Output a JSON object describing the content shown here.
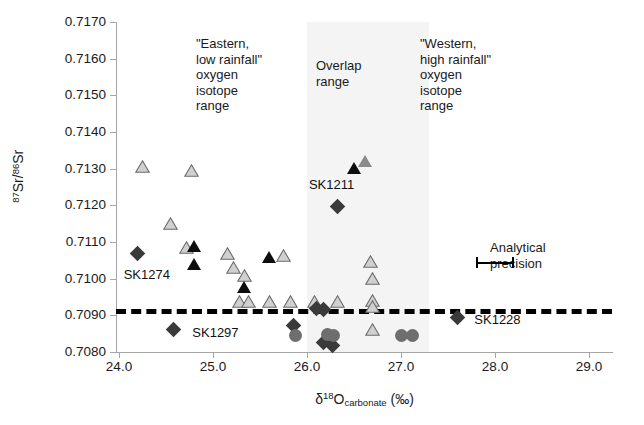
{
  "chart_data": {
    "type": "scatter",
    "title": "",
    "xlabel": "δ18O carbonate (‰)",
    "ylabel": "87Sr/86Sr",
    "xlim": [
      24.0,
      29.0
    ],
    "ylim": [
      0.708,
      0.717
    ],
    "xticks": [
      "24.0",
      "25.0",
      "26.0",
      "27.0",
      "28.0",
      "29.0"
    ],
    "yticks": [
      "0.7170",
      "0.7160",
      "0.7150",
      "0.7140",
      "0.7130",
      "0.7120",
      "0.7110",
      "0.7100",
      "0.7090",
      "0.7080"
    ],
    "grid": false,
    "legend": "none",
    "reference_line": {
      "label": "local biosphere baseline",
      "y": 0.70918,
      "style": "dashed",
      "color": "#000000"
    },
    "shaded_bands": [
      {
        "name": "overlap-range",
        "x_start": 26.0,
        "x_end": 27.3,
        "color": "#f4f4f4"
      }
    ],
    "error_bar": {
      "label": "Analytical precision",
      "x_start": 27.8,
      "x_end": 28.2,
      "y": 0.71045
    },
    "series": [
      {
        "name": "open-triangle",
        "marker": "triangle-open",
        "color": "#cccccc",
        "points": [
          {
            "x": 24.25,
            "y": 0.71305
          },
          {
            "x": 24.77,
            "y": 0.71295
          },
          {
            "x": 24.55,
            "y": 0.7115
          },
          {
            "x": 24.72,
            "y": 0.71085
          },
          {
            "x": 25.15,
            "y": 0.7107
          },
          {
            "x": 25.22,
            "y": 0.7103
          },
          {
            "x": 25.33,
            "y": 0.7101
          },
          {
            "x": 25.75,
            "y": 0.71062
          },
          {
            "x": 25.28,
            "y": 0.70938
          },
          {
            "x": 25.38,
            "y": 0.70938
          },
          {
            "x": 25.6,
            "y": 0.70938
          },
          {
            "x": 25.82,
            "y": 0.70938
          },
          {
            "x": 26.08,
            "y": 0.70938
          },
          {
            "x": 26.32,
            "y": 0.70938
          },
          {
            "x": 26.68,
            "y": 0.71048
          },
          {
            "x": 26.7,
            "y": 0.71
          },
          {
            "x": 26.7,
            "y": 0.7094
          },
          {
            "x": 26.7,
            "y": 0.70925
          },
          {
            "x": 26.7,
            "y": 0.70862
          }
        ]
      },
      {
        "name": "grey-triangle",
        "marker": "triangle-grey",
        "color": "#8a8a8a",
        "points": [
          {
            "x": 26.62,
            "y": 0.7132
          }
        ]
      },
      {
        "name": "filled-triangle",
        "marker": "triangle-filled",
        "color": "#0d0d0d",
        "points": [
          {
            "x": 24.8,
            "y": 0.7109
          },
          {
            "x": 24.8,
            "y": 0.7104
          },
          {
            "x": 25.33,
            "y": 0.70978
          },
          {
            "x": 25.6,
            "y": 0.71058
          },
          {
            "x": 26.5,
            "y": 0.71302
          }
        ]
      },
      {
        "name": "dark-diamond",
        "marker": "diamond",
        "color": "#3a3a3a",
        "points": [
          {
            "x": 24.22,
            "y": 0.71062
          },
          {
            "x": 24.6,
            "y": 0.70855
          },
          {
            "x": 25.88,
            "y": 0.70865
          },
          {
            "x": 26.2,
            "y": 0.7091
          },
          {
            "x": 26.2,
            "y": 0.7082
          },
          {
            "x": 26.3,
            "y": 0.70812
          },
          {
            "x": 26.12,
            "y": 0.70912
          },
          {
            "x": 26.35,
            "y": 0.7119
          },
          {
            "x": 27.62,
            "y": 0.70888
          }
        ]
      },
      {
        "name": "grey-circle",
        "marker": "circle",
        "color": "#6e6e6e",
        "points": [
          {
            "x": 25.88,
            "y": 0.70845
          },
          {
            "x": 26.28,
            "y": 0.70845
          },
          {
            "x": 26.22,
            "y": 0.70848
          },
          {
            "x": 27.0,
            "y": 0.70845
          },
          {
            "x": 27.12,
            "y": 0.70845
          }
        ]
      }
    ],
    "point_labels": [
      {
        "text": "SK1274",
        "x": 24.05,
        "y": 0.7101
      },
      {
        "text": "SK1297",
        "x": 24.78,
        "y": 0.70853
      },
      {
        "text": "SK1211",
        "x": 26.02,
        "y": 0.71255
      },
      {
        "text": "SK1228",
        "x": 27.78,
        "y": 0.70888
      }
    ]
  },
  "annotations": {
    "eastern": "\"Eastern,\nlow rainfall\"\noxygen\nisotope\nrange",
    "overlap": "Overlap\nrange",
    "western": "\"Western,\nhigh rainfall\"\noxygen\nisotope\nrange",
    "precision": "Analytical\nprecision"
  },
  "axis_titles": {
    "y_prefix": "87",
    "y_mid": "Sr/",
    "y_sup2": "86",
    "y_suffix": "Sr",
    "x_delta": "δ",
    "x_sup": "18",
    "x_o": "O",
    "x_sub": "carbonate",
    "x_unit": "(‰)"
  }
}
